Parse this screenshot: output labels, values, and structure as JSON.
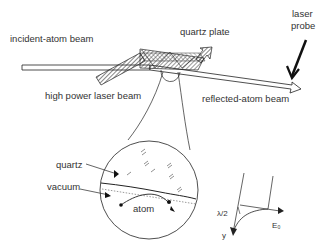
{
  "diagram": {
    "labels": {
      "incident_beam": "incident-atom beam",
      "quartz_plate": "quartz plate",
      "laser_probe_line1": "laser",
      "laser_probe_line2": "probe",
      "high_power_laser": "high power laser beam",
      "reflected_beam": "reflected-atom beam",
      "quartz": "quartz",
      "vacuum": "vacuum",
      "atom": "atom",
      "lambda_half": "λ/2",
      "y_axis": "y",
      "energy": "E₀"
    },
    "colors": {
      "line": "#222222",
      "text": "#333333",
      "background": "#ffffff"
    }
  }
}
